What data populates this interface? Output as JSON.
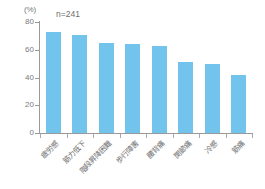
{
  "chart_data": {
    "type": "bar",
    "title": "",
    "subtitle": "",
    "xlabel": "",
    "ylabel": "(%)",
    "unit_label": "(%)",
    "annotation": "n=241",
    "ylim": [
      0,
      80
    ],
    "yticks": [
      "0",
      "20",
      "40",
      "60",
      "80"
    ],
    "grid": false,
    "legend": "none",
    "bar_color": "#72c4ec",
    "axis_color": "#9a9a9a",
    "text_color": "#6e6e6e",
    "categories": [
      "疲労感",
      "筋力低下",
      "階段昇降困難",
      "歩行障害",
      "腰背痛",
      "関節痛",
      "冷感",
      "筋痛"
    ],
    "values": [
      73,
      71,
      65,
      64,
      63,
      51,
      50,
      42
    ]
  }
}
